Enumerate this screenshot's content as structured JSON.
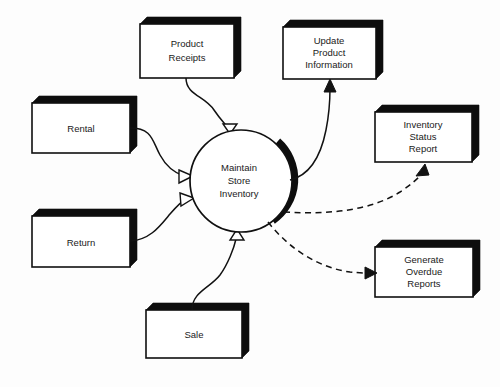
{
  "diagram": {
    "type": "data-flow-diagram",
    "background_color": "#fdfdfd",
    "line_color": "#121212",
    "box_fill_color": "#ffffff",
    "shadow_color": "#0d0d0d",
    "process": {
      "id": "maintain-store-inventory",
      "shape": "circle",
      "line1": "Maintain",
      "line2": "Store",
      "line3": "Inventory",
      "center_x": 241,
      "center_y": 181,
      "radius": 51
    },
    "external_entities": [
      {
        "id": "product-receipts",
        "line1": "Product",
        "line2": "Receipts",
        "x": 140,
        "y": 24,
        "width": 94,
        "height": 54
      },
      {
        "id": "rental",
        "line1": "Rental",
        "line2": "",
        "x": 32,
        "y": 103,
        "width": 98,
        "height": 50
      },
      {
        "id": "return",
        "line1": "Return",
        "line2": "",
        "x": 32,
        "y": 216,
        "width": 98,
        "height": 51
      },
      {
        "id": "sale",
        "line1": "Sale",
        "line2": "",
        "x": 146,
        "y": 310,
        "width": 96,
        "height": 48
      },
      {
        "id": "update-product-information",
        "line1": "Update",
        "line2": "Product",
        "line3": "Information",
        "x": 283,
        "y": 27,
        "width": 93,
        "height": 52
      },
      {
        "id": "inventory-status-report",
        "line1": "Inventory",
        "line2": "Status",
        "line3": "Report",
        "x": 375,
        "y": 112,
        "width": 97,
        "height": 50
      },
      {
        "id": "generate-overdue-reports",
        "line1": "Generate",
        "line2": "Overdue",
        "line3": "Reports",
        "x": 375,
        "y": 247,
        "width": 98,
        "height": 50
      }
    ],
    "flows": [
      {
        "id": "flow-product-receipts-to-process",
        "from": "product-receipts",
        "to": "maintain-store-inventory",
        "style": "solid",
        "arrowhead": "open-triangle",
        "label": ""
      },
      {
        "id": "flow-rental-to-process",
        "from": "rental",
        "to": "maintain-store-inventory",
        "style": "solid",
        "arrowhead": "open-triangle",
        "label": ""
      },
      {
        "id": "flow-return-to-process",
        "from": "return",
        "to": "maintain-store-inventory",
        "style": "solid",
        "arrowhead": "open-triangle",
        "label": ""
      },
      {
        "id": "flow-sale-to-process",
        "from": "sale",
        "to": "maintain-store-inventory",
        "style": "solid",
        "arrowhead": "open-triangle",
        "label": ""
      },
      {
        "id": "flow-process-to-update-product-information",
        "from": "maintain-store-inventory",
        "to": "update-product-information",
        "style": "solid",
        "arrowhead": "filled-triangle",
        "label": ""
      },
      {
        "id": "flow-process-to-inventory-status-report",
        "from": "maintain-store-inventory",
        "to": "inventory-status-report",
        "style": "dashed",
        "arrowhead": "filled-triangle",
        "label": ""
      },
      {
        "id": "flow-process-to-generate-overdue-reports",
        "from": "maintain-store-inventory",
        "to": "generate-overdue-reports",
        "style": "dashed",
        "arrowhead": "filled-triangle",
        "label": ""
      }
    ]
  }
}
